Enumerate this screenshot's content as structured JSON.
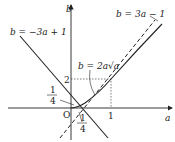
{
  "axes": {
    "x_label": "a",
    "y_label": "b",
    "origin_label": "O",
    "x_tick_label": "1",
    "y_tick_label": "2"
  },
  "fractions": {
    "left": {
      "num": "1",
      "den": "4"
    },
    "bottom": {
      "num": "1",
      "den": "4"
    }
  },
  "curves": {
    "line_neg": "b = −3a + 1",
    "line_pos": "b = 3a − 1",
    "curve": "b = 2a√a"
  },
  "colors": {
    "ink": "#222222",
    "dotted": "#444444"
  }
}
